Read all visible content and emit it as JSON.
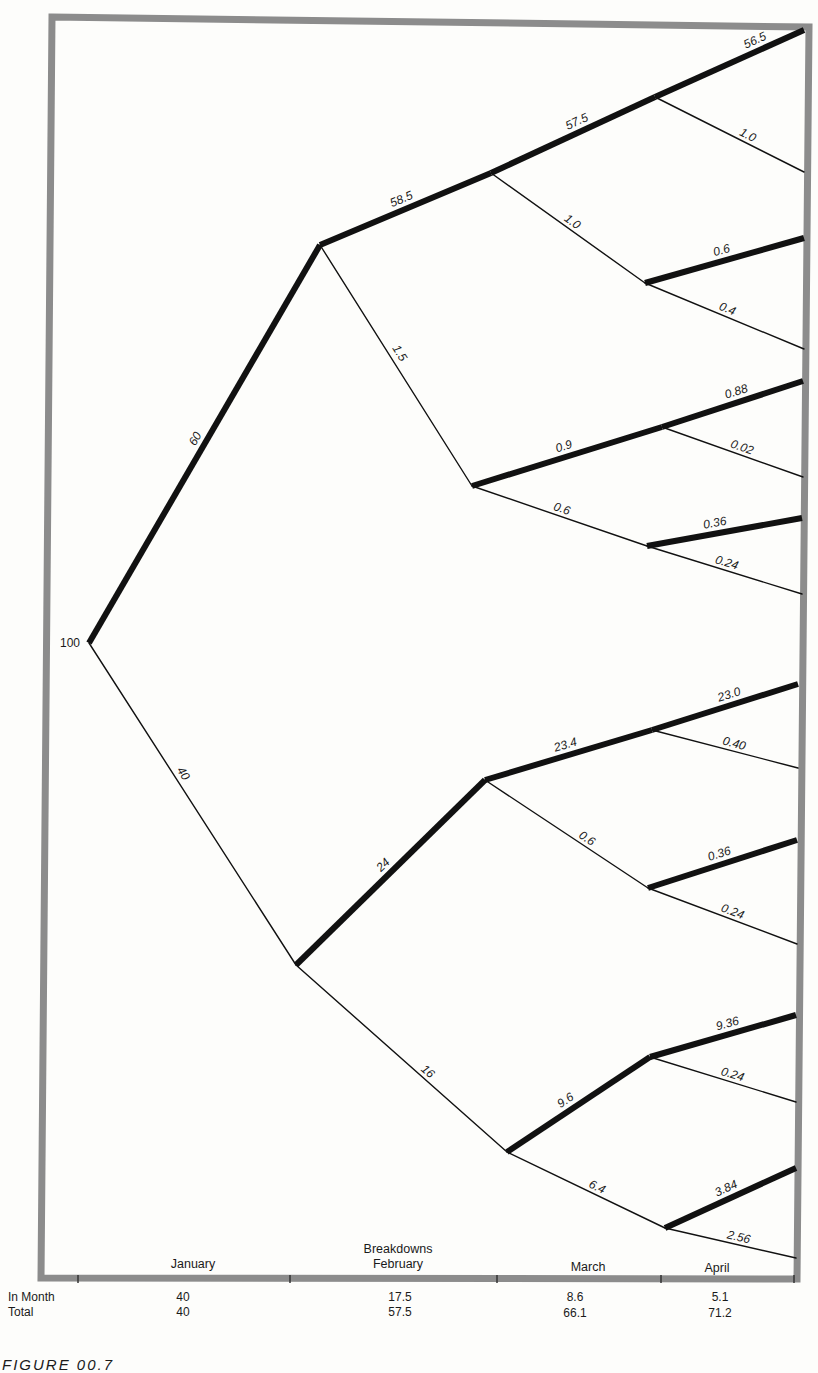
{
  "figure": {
    "caption": "FIGURE 00.7",
    "root_value": "100",
    "frame_color": "#8c8c8c",
    "line_color": "#111111"
  },
  "axis": {
    "header": "Breakdowns",
    "months": [
      "January",
      "February",
      "March",
      "April"
    ]
  },
  "table": {
    "rows": [
      {
        "label": "In Month",
        "values": [
          "40",
          "17.5",
          "8.6",
          "5.1"
        ]
      },
      {
        "label": "Total",
        "values": [
          "40",
          "57.5",
          "66.1",
          "71.2"
        ]
      }
    ]
  },
  "chart_data": {
    "type": "tree",
    "root": 100,
    "edges": [
      {
        "from": "root",
        "to": "A",
        "value": "60",
        "bold": true
      },
      {
        "from": "root",
        "to": "B",
        "value": "40",
        "bold": false
      },
      {
        "from": "A",
        "to": "A1",
        "value": "58.5",
        "bold": true
      },
      {
        "from": "A",
        "to": "A2",
        "value": "1.5",
        "bold": false
      },
      {
        "from": "A1",
        "to": "A11",
        "value": "57.5",
        "bold": true
      },
      {
        "from": "A1",
        "to": "A12",
        "value": "1.0",
        "bold": false
      },
      {
        "from": "A11",
        "to": "end",
        "value": "56.5",
        "bold": true
      },
      {
        "from": "A11",
        "to": "end",
        "value": "1.0",
        "bold": false
      },
      {
        "from": "A12",
        "to": "end",
        "value": "0.6",
        "bold": true
      },
      {
        "from": "A12",
        "to": "end",
        "value": "0.4",
        "bold": false
      },
      {
        "from": "A2",
        "to": "A21",
        "value": "0.9",
        "bold": true
      },
      {
        "from": "A2",
        "to": "A22",
        "value": "0.6",
        "bold": false
      },
      {
        "from": "A21",
        "to": "end",
        "value": "0.88",
        "bold": true
      },
      {
        "from": "A21",
        "to": "end",
        "value": "0.02",
        "bold": false
      },
      {
        "from": "A22",
        "to": "end",
        "value": "0.36",
        "bold": true
      },
      {
        "from": "A22",
        "to": "end",
        "value": "0.24",
        "bold": false
      },
      {
        "from": "B",
        "to": "B1",
        "value": "24",
        "bold": true
      },
      {
        "from": "B",
        "to": "B2",
        "value": "16",
        "bold": false
      },
      {
        "from": "B1",
        "to": "B11",
        "value": "23.4",
        "bold": true
      },
      {
        "from": "B1",
        "to": "B12",
        "value": "0.6",
        "bold": false
      },
      {
        "from": "B11",
        "to": "end",
        "value": "23.0",
        "bold": true
      },
      {
        "from": "B11",
        "to": "end",
        "value": "0.40",
        "bold": false
      },
      {
        "from": "B12",
        "to": "end",
        "value": "0.36",
        "bold": true
      },
      {
        "from": "B12",
        "to": "end",
        "value": "0.24",
        "bold": false
      },
      {
        "from": "B2",
        "to": "B21",
        "value": "9.6",
        "bold": true
      },
      {
        "from": "B2",
        "to": "B22",
        "value": "6.4",
        "bold": false
      },
      {
        "from": "B21",
        "to": "end",
        "value": "9.36",
        "bold": true
      },
      {
        "from": "B21",
        "to": "end",
        "value": "0.24",
        "bold": false
      },
      {
        "from": "B22",
        "to": "end",
        "value": "3.84",
        "bold": true
      },
      {
        "from": "B22",
        "to": "end",
        "value": "2.56",
        "bold": false
      }
    ],
    "columns": [
      "January",
      "February",
      "March",
      "April"
    ],
    "breakdowns_in_month": [
      40,
      17.5,
      8.6,
      5.1
    ],
    "breakdowns_total": [
      40,
      57.5,
      66.1,
      71.2
    ]
  },
  "geometry": {
    "nodes": {
      "root": [
        89,
        643
      ],
      "A": [
        320,
        245
      ],
      "B": [
        296,
        965
      ],
      "A1": [
        491,
        173
      ],
      "A2": [
        472,
        486
      ],
      "B1": [
        485,
        780
      ],
      "B2": [
        507,
        1152
      ],
      "A11": [
        655,
        97
      ],
      "A12": [
        645,
        283
      ],
      "A21": [
        662,
        427
      ],
      "A22": [
        647,
        546
      ],
      "B11": [
        652,
        730
      ],
      "B12": [
        648,
        888
      ],
      "B21": [
        650,
        1057
      ],
      "B22": [
        665,
        1228
      ]
    },
    "segments": [
      {
        "a": "root",
        "b": "A",
        "bold": true,
        "label": "60",
        "t": 0.5,
        "off": -7
      },
      {
        "a": "root",
        "b": "B",
        "bold": false,
        "label": "40",
        "t": 0.42,
        "off": -7
      },
      {
        "a": "A",
        "b": "A1",
        "bold": true,
        "label": "58.5",
        "t": 0.5,
        "off": -7
      },
      {
        "a": "A",
        "b": "A2",
        "bold": false,
        "label": "1.5",
        "t": 0.47,
        "off": 8
      },
      {
        "a": "A1",
        "b": "A11",
        "bold": true,
        "label": "57.5",
        "t": 0.55,
        "off": -7
      },
      {
        "a": "A1",
        "b": "A12",
        "bold": false,
        "label": "1.0",
        "t": 0.5,
        "off": -6
      },
      {
        "a": "A11",
        "b": [
          804,
          30
        ],
        "bold": true,
        "label": "56.5",
        "t": 0.7,
        "off": -7
      },
      {
        "a": "A11",
        "b": [
          804,
          172
        ],
        "bold": false,
        "label": "1.0",
        "t": 0.6,
        "off": -6
      },
      {
        "a": "A12",
        "b": [
          804,
          238
        ],
        "bold": true,
        "label": "0.6",
        "t": 0.5,
        "off": -7
      },
      {
        "a": "A12",
        "b": [
          804,
          349
        ],
        "bold": false,
        "label": "0.4",
        "t": 0.5,
        "off": -6
      },
      {
        "a": "A2",
        "b": "A21",
        "bold": true,
        "label": "0.9",
        "t": 0.5,
        "off": -7
      },
      {
        "a": "A2",
        "b": "A22",
        "bold": false,
        "label": "0.6",
        "t": 0.5,
        "off": -6
      },
      {
        "a": "A21",
        "b": [
          803,
          381
        ],
        "bold": true,
        "label": "0.88",
        "t": 0.55,
        "off": -7
      },
      {
        "a": "A21",
        "b": [
          803,
          477
        ],
        "bold": false,
        "label": "0.02",
        "t": 0.55,
        "off": -6
      },
      {
        "a": "A22",
        "b": [
          802,
          518
        ],
        "bold": true,
        "label": "0.36",
        "t": 0.45,
        "off": -7
      },
      {
        "a": "A22",
        "b": [
          802,
          594
        ],
        "bold": false,
        "label": "0.24",
        "t": 0.5,
        "off": -6
      },
      {
        "a": "B",
        "b": "B1",
        "bold": true,
        "label": "24",
        "t": 0.5,
        "off": -7
      },
      {
        "a": "B",
        "b": "B2",
        "bold": false,
        "label": "16",
        "t": 0.6,
        "off": -6
      },
      {
        "a": "B1",
        "b": "B11",
        "bold": true,
        "label": "23.4",
        "t": 0.5,
        "off": -7
      },
      {
        "a": "B1",
        "b": "B12",
        "bold": false,
        "label": "0.6",
        "t": 0.6,
        "off": -6
      },
      {
        "a": "B11",
        "b": [
          798,
          684
        ],
        "bold": true,
        "label": "23.0",
        "t": 0.55,
        "off": -7
      },
      {
        "a": "B11",
        "b": [
          798,
          768
        ],
        "bold": false,
        "label": "0.40",
        "t": 0.55,
        "off": -6
      },
      {
        "a": "B12",
        "b": [
          797,
          840
        ],
        "bold": true,
        "label": "0.36",
        "t": 0.5,
        "off": -7
      },
      {
        "a": "B12",
        "b": [
          797,
          944
        ],
        "bold": false,
        "label": "0.24",
        "t": 0.55,
        "off": -6
      },
      {
        "a": "B2",
        "b": "B21",
        "bold": true,
        "label": "9.6",
        "t": 0.45,
        "off": -7
      },
      {
        "a": "B2",
        "b": "B22",
        "bold": false,
        "label": "6.4",
        "t": 0.55,
        "off": -6
      },
      {
        "a": "B21",
        "b": [
          796,
          1015
        ],
        "bold": true,
        "label": "9.36",
        "t": 0.55,
        "off": -7
      },
      {
        "a": "B21",
        "b": [
          796,
          1102
        ],
        "bold": false,
        "label": "0.24",
        "t": 0.55,
        "off": -6
      },
      {
        "a": "B22",
        "b": [
          796,
          1168
        ],
        "bold": true,
        "label": "3.84",
        "t": 0.5,
        "off": -7
      },
      {
        "a": "B22",
        "b": [
          796,
          1258
        ],
        "bold": false,
        "label": "2.56",
        "t": 0.55,
        "off": -6
      }
    ],
    "ticks_x": [
      78,
      290,
      497,
      661,
      794
    ],
    "month_label_x": [
      193,
      398,
      588,
      717
    ]
  }
}
